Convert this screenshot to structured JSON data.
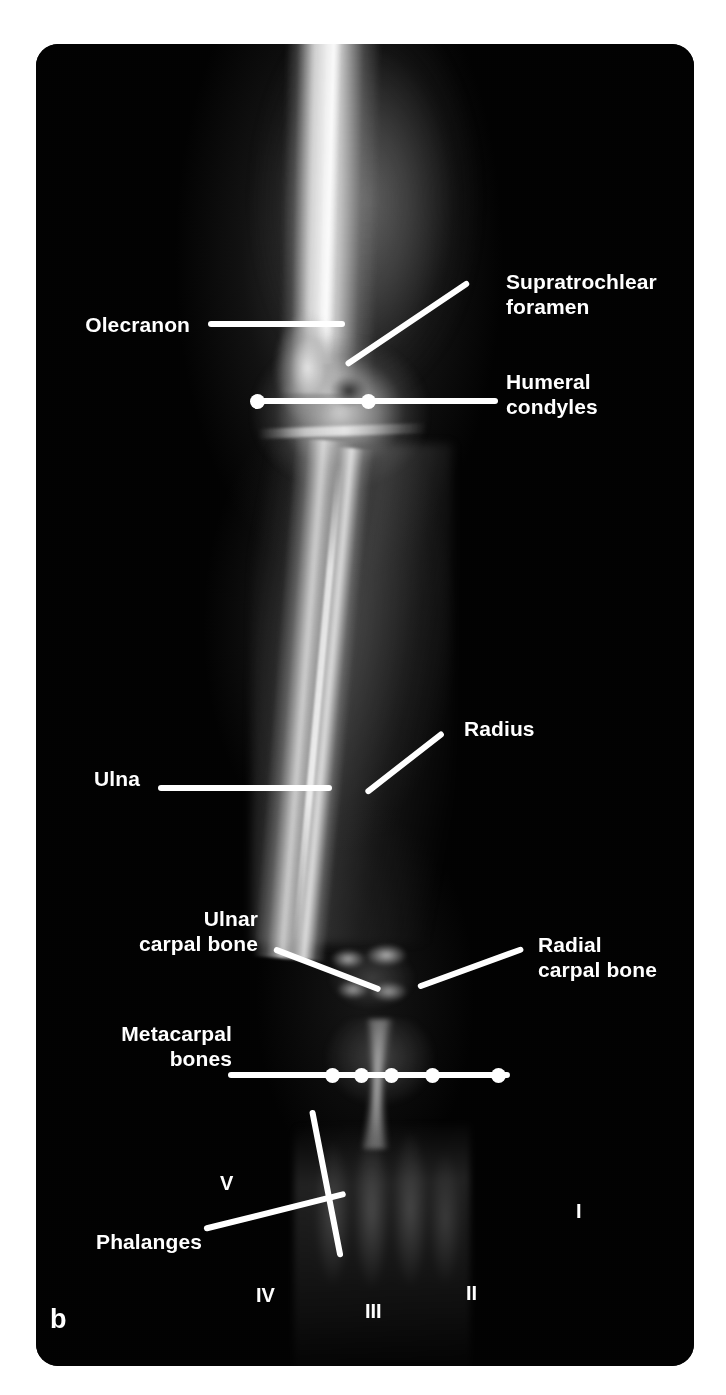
{
  "figure": {
    "panel_letter": "b",
    "type": "radiograph",
    "view": "craniocaudal forelimb radiograph with anatomical leader-line annotations",
    "background_color": "#ffffff",
    "plate_color": "#020202",
    "annotation_color": "#ffffff"
  },
  "labels": {
    "olecranon": "Olecranon",
    "supratrochlear_foramen": "Supratrochlear\nforamen",
    "humeral_condyles": "Humeral\ncondyles",
    "radius": "Radius",
    "ulna": "Ulna",
    "ulnar_carpal_bone": "Ulnar\ncarpal bone",
    "radial_carpal_bone": "Radial\ncarpal bone",
    "metacarpal_bones": "Metacarpal\nbones",
    "phalanges": "Phalanges"
  },
  "digits": {
    "one": "I",
    "two": "II",
    "three": "III",
    "four": "IV",
    "five": "V"
  }
}
